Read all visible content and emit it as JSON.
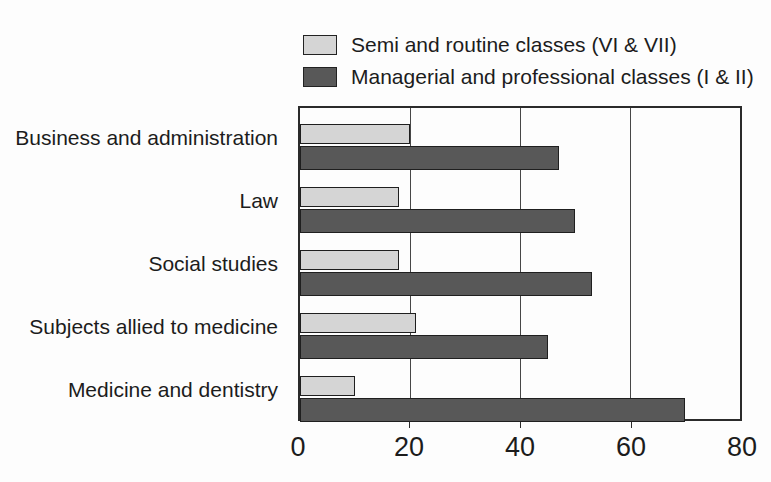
{
  "chart_data": {
    "type": "bar",
    "orientation": "horizontal",
    "title": "",
    "xlabel": "",
    "ylabel": "",
    "categories": [
      "Business and administration",
      "Law",
      "Social studies",
      "Subjects allied to medicine",
      "Medicine and dentistry"
    ],
    "series": [
      {
        "name": "Semi and routine classes (VI & VII)",
        "color": "#d5d5d5",
        "values": [
          20,
          18,
          18,
          21,
          10
        ]
      },
      {
        "name": "Managerial and professional classes (I & II)",
        "color": "#585858",
        "values": [
          47,
          50,
          53,
          45,
          70
        ]
      }
    ],
    "xlim": [
      0,
      80
    ],
    "x_ticks": [
      0,
      20,
      40,
      60,
      80
    ],
    "grid": "vertical-gridlines-at-inner-ticks",
    "legend_position": "top-right"
  },
  "style": {
    "background": "#fdfdfd",
    "text_color": "#1c1c1c",
    "border_color": "#2b2b2b",
    "semi_routine_fill": "#d5d5d5",
    "managerial_fill": "#585858"
  }
}
